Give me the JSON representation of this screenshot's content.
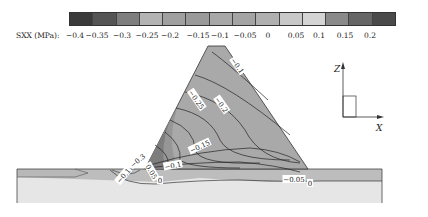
{
  "legend": {
    "title": "SXX (MPa):",
    "ticks": [
      "−0.4",
      "−0.35",
      "−0.3",
      "−0.25",
      "−0.2",
      "−0.15",
      "−0.1",
      "−0.05",
      "0",
      "0.05",
      "0.1",
      "0.15",
      "0.2"
    ],
    "colors": [
      "#3a3a3a",
      "#555555",
      "#7e7e7e",
      "#b3b3b3",
      "#a0a0a0",
      "#9a9a9a",
      "#a8a8a8",
      "#a4a4a4",
      "#b0b0b0",
      "#c8c8c8",
      "#d4d4d4",
      "#8a8a8a",
      "#666666",
      "#4a4a4a"
    ]
  },
  "contour_labels": [
    {
      "text": "−0.1",
      "x": 237,
      "y": 66,
      "rot": 55
    },
    {
      "text": "−0.25",
      "x": 196,
      "y": 100,
      "rot": 55
    },
    {
      "text": "−0.2",
      "x": 221,
      "y": 105,
      "rot": 55
    },
    {
      "text": "−0.15",
      "x": 200,
      "y": 147,
      "rot": -25
    },
    {
      "text": "−0.1",
      "x": 173,
      "y": 166,
      "rot": -10
    },
    {
      "text": "−0.3",
      "x": 138,
      "y": 161,
      "rot": -40
    },
    {
      "text": "−0.1",
      "x": 124,
      "y": 176,
      "rot": -50
    },
    {
      "text": "0.05",
      "x": 151,
      "y": 172,
      "rot": 60
    },
    {
      "text": "0",
      "x": 160,
      "y": 181,
      "rot": 0
    },
    {
      "text": "−0.05",
      "x": 294,
      "y": 180,
      "rot": 0
    },
    {
      "text": "0",
      "x": 310,
      "y": 184,
      "rot": 0
    }
  ],
  "axes": {
    "z_label": "Z",
    "x_label": "X"
  },
  "chart_data": {
    "type": "heatmap",
    "variable": "SXX",
    "units": "MPa",
    "legend_range": [
      -0.4,
      0.2
    ],
    "legend_step": 0.05,
    "legend_ticks": [
      -0.4,
      -0.35,
      -0.3,
      -0.25,
      -0.2,
      -0.15,
      -0.1,
      -0.05,
      0,
      0.05,
      0.1,
      0.15,
      0.2
    ],
    "contour_levels_labeled": [
      -0.3,
      -0.25,
      -0.2,
      -0.15,
      -0.1,
      -0.05,
      0,
      0.05
    ],
    "regions": {
      "dam_body": "triangular embankment",
      "foundation": "horizontal layered foundation"
    }
  }
}
